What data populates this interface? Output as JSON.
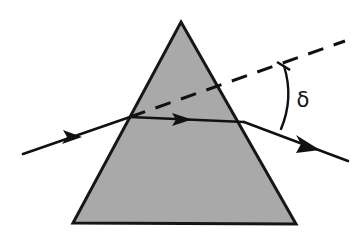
{
  "figure": {
    "background_color": "#ffffff",
    "width": 352,
    "height": 243
  },
  "prism": {
    "name": "triangular-prism",
    "shape": "triangle",
    "fill_color": "#a9a9a9",
    "stroke_color": "#161616",
    "stroke_width": 3,
    "apex": {
      "x": 181,
      "y": 22
    },
    "bottom_left": {
      "x": 73,
      "y": 223
    },
    "bottom_right": {
      "x": 296,
      "y": 224
    }
  },
  "rays": {
    "incident": {
      "name": "incident-ray",
      "start": {
        "x": 23,
        "y": 154
      },
      "end": {
        "x": 130,
        "y": 117
      },
      "arrow_at": {
        "x": 73,
        "y": 137
      },
      "color": "#111111"
    },
    "internal": {
      "name": "internal-ray",
      "start": {
        "x": 130,
        "y": 117
      },
      "end": {
        "x": 244,
        "y": 122
      },
      "arrow_at": {
        "x": 184,
        "y": 119
      },
      "color": "#111111"
    },
    "emergent": {
      "name": "emergent-ray",
      "start": {
        "x": 244,
        "y": 122
      },
      "end": {
        "x": 348,
        "y": 161
      },
      "arrow_at": {
        "x": 310,
        "y": 147
      },
      "color": "#111111"
    },
    "extension": {
      "name": "incident-ray-extension-dashed",
      "start": {
        "x": 130,
        "y": 117
      },
      "end": {
        "x": 345,
        "y": 41
      },
      "style": "dashed",
      "dash_pattern": "16 11",
      "color": "#111111"
    }
  },
  "annotations": {
    "deviation_angle": {
      "name": "deviation-angle",
      "symbol": "δ",
      "label_position": {
        "x": 303,
        "y": 107
      },
      "arc_start": {
        "x": 284,
        "y": 66
      },
      "arc_end": {
        "x": 281,
        "y": 129
      },
      "tick_on_dashed": true
    }
  }
}
